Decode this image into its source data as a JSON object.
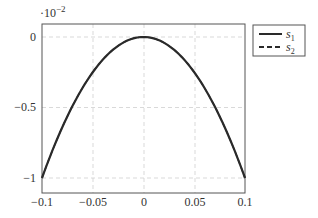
{
  "chart_data": {
    "type": "line",
    "title": "",
    "xlabel": "",
    "ylabel": "",
    "y_scale_note": "·10^-2",
    "xlim": [
      -0.1,
      0.1
    ],
    "ylim": [
      -1.1,
      0.1
    ],
    "grid": true,
    "legend_position": "outside-right-top",
    "x_ticks": [
      "−0.1",
      "−0.05",
      "0",
      "0.05",
      "0.1"
    ],
    "y_ticks": [
      "0",
      "−0.5",
      "−1"
    ],
    "x": [
      -0.1,
      -0.075,
      -0.05,
      -0.025,
      0,
      0.025,
      0.05,
      0.075,
      0.1
    ],
    "series": [
      {
        "name": "s1",
        "style": "solid",
        "values": [
          -1.0,
          -0.5625,
          -0.25,
          -0.0625,
          0.0,
          -0.0625,
          -0.25,
          -0.5625,
          -1.0
        ]
      },
      {
        "name": "s2",
        "style": "dashed",
        "values": [
          -1.0,
          -0.5625,
          -0.25,
          -0.0625,
          0.0,
          -0.0625,
          -0.25,
          -0.5625,
          -1.0
        ]
      }
    ]
  },
  "labels": {
    "multiplier_base": "·10",
    "multiplier_exp": "−2",
    "xticks": [
      "−0.1",
      "−0.05",
      "0",
      "0.05",
      "0.1"
    ],
    "yticks": [
      "0",
      "−0.5",
      "−1"
    ],
    "legend": [
      {
        "sym": "s",
        "sub": "1"
      },
      {
        "sym": "s",
        "sub": "2"
      }
    ]
  },
  "colors": {
    "line": "#2a2a2a",
    "grid": "#c8c8c8",
    "axis": "#555555"
  }
}
